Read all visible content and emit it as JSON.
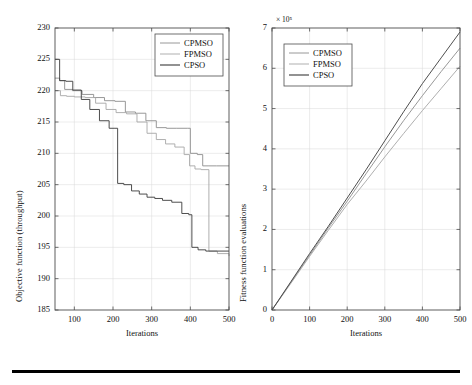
{
  "figure": {
    "background_color": "#ffffff",
    "bottom_rule": true
  },
  "chart_data": [
    {
      "id": "left-panel",
      "type": "line",
      "step": true,
      "title": "",
      "xlabel": "Iterations",
      "ylabel": "Objective function (throughput)",
      "xlim": [
        50,
        500
      ],
      "ylim": [
        185,
        230
      ],
      "xticks": [
        100,
        200,
        300,
        400,
        500
      ],
      "yticks": [
        185,
        190,
        195,
        200,
        205,
        210,
        215,
        220,
        225,
        230
      ],
      "grid": true,
      "legend_position": "top-right",
      "legend": [
        "CPMSO",
        "FPMSO",
        "CPSO"
      ],
      "colors": [
        "#8c8c8c",
        "#a6a6a6",
        "#3a3a3a"
      ],
      "series": [
        {
          "name": "CPMSO",
          "color": "#8c8c8c",
          "x": [
            50,
            62,
            75,
            95,
            120,
            150,
            178,
            205,
            232,
            258,
            285,
            312,
            338,
            365,
            392,
            400,
            418,
            432,
            448,
            468,
            500
          ],
          "y": [
            222,
            221.6,
            220.2,
            220.0,
            219.4,
            218.9,
            218.4,
            218.3,
            216.6,
            216.4,
            215.2,
            214.1,
            214.0,
            214.0,
            214.0,
            210.0,
            209.8,
            208.0,
            208.0,
            208.0,
            208.0
          ]
        },
        {
          "name": "FPMSO",
          "color": "#a6a6a6",
          "x": [
            50,
            64,
            80,
            100,
            128,
            155,
            182,
            208,
            235,
            262,
            288,
            312,
            336,
            360,
            384,
            398,
            412,
            428,
            448,
            470,
            500
          ],
          "y": [
            220.0,
            219.2,
            219.1,
            219.0,
            218.9,
            218.0,
            217.0,
            216.5,
            216.3,
            215.0,
            213.2,
            212.2,
            211.5,
            211.0,
            209.8,
            208.0,
            207.5,
            207.4,
            194.4,
            194.0,
            193.6
          ]
        },
        {
          "name": "CPSO",
          "color": "#3a3a3a",
          "x": [
            50,
            56,
            62,
            78,
            96,
            118,
            140,
            165,
            190,
            205,
            212,
            228,
            248,
            268,
            288,
            308,
            328,
            352,
            378,
            396,
            404,
            420,
            440,
            470,
            500
          ],
          "y": [
            225.0,
            225.0,
            221.6,
            221.5,
            220.1,
            218.6,
            217.0,
            215.2,
            214.0,
            214.0,
            205.2,
            205.0,
            204.0,
            203.5,
            203.0,
            202.8,
            202.5,
            202.2,
            200.4,
            200.2,
            195.0,
            194.6,
            194.4,
            194.4,
            194.4
          ]
        }
      ]
    },
    {
      "id": "right-panel",
      "type": "line",
      "step": false,
      "title": "",
      "xlabel": "Iterations",
      "ylabel": "Fitness function evaluations",
      "y_exponent": "× 10⁵",
      "xlim": [
        0,
        500
      ],
      "ylim": [
        0,
        7
      ],
      "xticks": [
        0,
        100,
        200,
        300,
        400,
        500
      ],
      "yticks": [
        0,
        1,
        2,
        3,
        4,
        5,
        6,
        7
      ],
      "grid": true,
      "legend_position": "top-left",
      "legend": [
        "CPMSO",
        "FPMSO",
        "CPSO"
      ],
      "colors": [
        "#8c8c8c",
        "#a6a6a6",
        "#3a3a3a"
      ],
      "series": [
        {
          "name": "CPMSO",
          "color": "#8c8c8c",
          "x": [
            0,
            50,
            100,
            150,
            200,
            250,
            300,
            350,
            400,
            450,
            500
          ],
          "y": [
            0,
            0.68,
            1.36,
            2.04,
            2.7,
            3.38,
            4.05,
            4.7,
            5.32,
            5.92,
            6.5
          ]
        },
        {
          "name": "FPMSO",
          "color": "#a6a6a6",
          "x": [
            0,
            50,
            100,
            150,
            200,
            250,
            300,
            350,
            400,
            450,
            500
          ],
          "y": [
            0,
            0.66,
            1.33,
            1.98,
            2.62,
            3.2,
            3.8,
            4.38,
            4.95,
            5.5,
            6.05
          ]
        },
        {
          "name": "CPSO",
          "color": "#3a3a3a",
          "x": [
            0,
            50,
            100,
            150,
            200,
            250,
            300,
            350,
            400,
            450,
            500
          ],
          "y": [
            0,
            0.7,
            1.4,
            2.08,
            2.78,
            3.48,
            4.2,
            4.92,
            5.62,
            6.26,
            6.9
          ]
        }
      ]
    }
  ]
}
